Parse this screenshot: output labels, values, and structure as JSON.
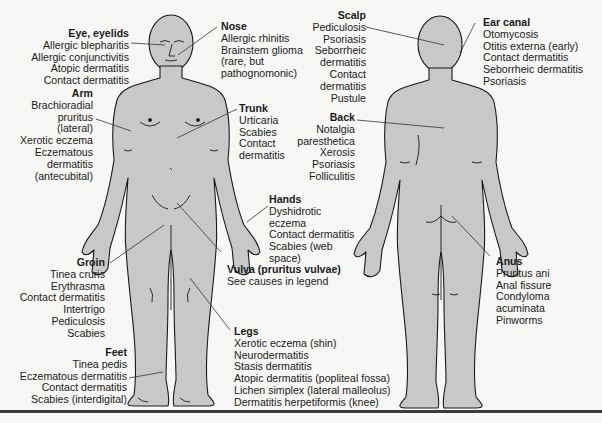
{
  "colors": {
    "body_fill": "#c8c8c8",
    "outline": "#1a1a1a",
    "background": "#f7f7f5",
    "leader_line": "#333333"
  },
  "figures": {
    "front": "anterior-body-view",
    "back": "posterior-body-view"
  },
  "regions": {
    "eye": {
      "title": "Eye, eyelids",
      "items": [
        "Allergic blepharitis",
        "Allergic conjunctivitis",
        "Atopic dermatitis",
        "Contact dermatitis"
      ]
    },
    "arm": {
      "title": "Arm",
      "items": [
        "Brachioradial",
        "pruritus",
        "(lateral)",
        "Xerotic eczema",
        "Eczematous",
        "dermatitis",
        "(antecubital)"
      ]
    },
    "groin": {
      "title": "Groin",
      "items": [
        "Tinea cruris",
        "Erythrasma",
        "Contact dermatitis",
        "Intertrigo",
        "Pediculosis",
        "Scabies"
      ]
    },
    "feet": {
      "title": "Feet",
      "items": [
        "Tinea pedis",
        "Eczematous dermatitis",
        "Contact dermatitis",
        "Scabies (interdigital)"
      ]
    },
    "nose": {
      "title": "Nose",
      "items": [
        "Allergic rhinitis",
        "Brainstem glioma",
        "(rare, but",
        "pathognomonic)"
      ]
    },
    "trunk": {
      "title": "Trunk",
      "items": [
        "Urticaria",
        "Scabies",
        "Contact",
        "dermatitis"
      ]
    },
    "hands": {
      "title": "Hands",
      "items": [
        "Dyshidrotic",
        "eczema",
        "Contact dermatitis",
        "Scabies (web",
        "space)"
      ]
    },
    "vulva": {
      "title": "Vulva (pruritus vulvae)",
      "items": [
        "See causes in legend"
      ]
    },
    "legs": {
      "title": "Legs",
      "items": [
        "Xerotic eczema (shin)",
        "Neurodermatitis",
        "Stasis dermatitis",
        "Atopic dermatitis (popliteal fossa)",
        "Lichen simplex (lateral malleolus)",
        "Dermatitis herpetiformis (knee)"
      ]
    },
    "scalp": {
      "title": "Scalp",
      "items": [
        "Pediculosis",
        "Psoriasis",
        "Seborrheic",
        "dermatitis",
        "Contact",
        "dermatitis",
        "Pustule"
      ]
    },
    "back": {
      "title": "Back",
      "items": [
        "Notalgia",
        "paresthetica",
        "Xerosis",
        "Psoriasis",
        "Folliculitis"
      ]
    },
    "ear": {
      "title": "Ear canal",
      "items": [
        "Otomycosis",
        "Otitis externa (early)",
        "Contact dermatitis",
        "Seborrheic dermatitis",
        "Psoriasis"
      ]
    },
    "anus": {
      "title": "Anus",
      "items": [
        "Pruritus ani",
        "Anal fissure",
        "Condyloma",
        "acuminata",
        "Pinworms"
      ]
    }
  }
}
